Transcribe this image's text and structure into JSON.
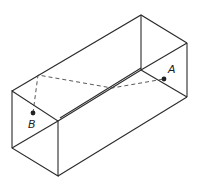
{
  "diagram": {
    "type": "rectangular-box-geodesic",
    "points": [
      {
        "label": "A",
        "x": 164,
        "y": 79
      },
      {
        "label": "B",
        "x": 33,
        "y": 113
      }
    ]
  }
}
